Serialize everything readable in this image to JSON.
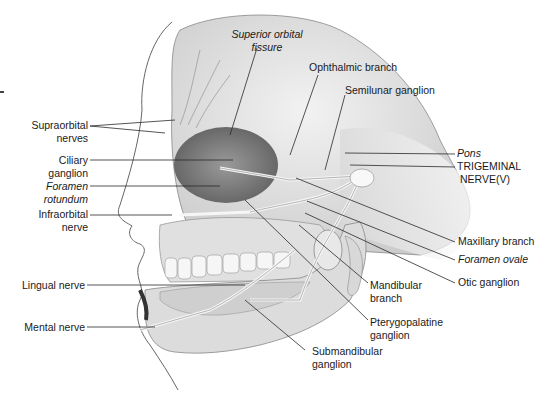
{
  "diagram": {
    "colors": {
      "background": "#ffffff",
      "bone": "#e6e6e6",
      "bone_shade": "#c8c8c8",
      "orbit": "#8f8f8f",
      "nerve": "#f4f4f4",
      "leader": "#2a2a2a",
      "text": "#1a1a1a"
    },
    "labels_left": [
      {
        "id": "supraorbital",
        "lines": [
          "Supraorbital",
          "nerves"
        ],
        "italic": false
      },
      {
        "id": "ciliary",
        "lines": [
          "Ciliary",
          "ganglion"
        ],
        "italic": false
      },
      {
        "id": "foramen-rotundum",
        "lines": [
          "Foramen",
          "rotundum"
        ],
        "italic": true
      },
      {
        "id": "infraorbital",
        "lines": [
          "Infraorbital",
          "nerve"
        ],
        "italic": false
      },
      {
        "id": "lingual",
        "lines": [
          "Lingual nerve"
        ],
        "italic": false
      },
      {
        "id": "mental",
        "lines": [
          "Mental nerve"
        ],
        "italic": false
      }
    ],
    "labels_top": [
      {
        "id": "superior-orbital-fissure",
        "lines": [
          "Superior orbital",
          "fissure"
        ],
        "italic": true
      },
      {
        "id": "ophthalmic",
        "lines": [
          "Ophthalmic branch"
        ],
        "italic": false
      },
      {
        "id": "semilunar",
        "lines": [
          "Semilunar ganglion"
        ],
        "italic": false
      }
    ],
    "labels_right": [
      {
        "id": "pons",
        "lines": [
          "Pons"
        ],
        "italic": true
      },
      {
        "id": "trigeminal",
        "lines": [
          "TRIGEMINAL",
          "NERVE(V)"
        ],
        "italic": false
      },
      {
        "id": "maxillary",
        "lines": [
          "Maxillary branch"
        ],
        "italic": false
      },
      {
        "id": "foramen-ovale",
        "lines": [
          "Foramen ovale"
        ],
        "italic": true
      },
      {
        "id": "otic",
        "lines": [
          "Otic ganglion"
        ],
        "italic": false
      }
    ],
    "labels_bottom": [
      {
        "id": "mandibular",
        "lines": [
          "Mandibular",
          "branch"
        ],
        "italic": false
      },
      {
        "id": "pterygopalatine",
        "lines": [
          "Pterygopalatine",
          "ganglion"
        ],
        "italic": false
      },
      {
        "id": "submandibular",
        "lines": [
          "Submandibular",
          "ganglion"
        ],
        "italic": false
      }
    ]
  }
}
